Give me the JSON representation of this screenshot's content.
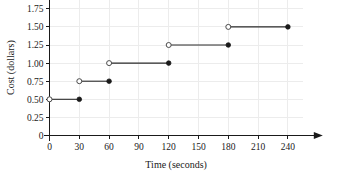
{
  "chart_data": {
    "type": "line",
    "title": "",
    "xlabel": "Time (seconds)",
    "ylabel": "Cost (dollars)",
    "xlim": [
      0,
      255
    ],
    "ylim": [
      0,
      1.875
    ],
    "grid": true,
    "legend": null,
    "xticks": [
      0,
      30,
      60,
      90,
      120,
      150,
      180,
      210,
      240
    ],
    "xtick_labels": [
      "0",
      "30",
      "60",
      "90",
      "120",
      "150",
      "180",
      "210",
      "240"
    ],
    "yticks": [
      0,
      0.25,
      0.5,
      0.75,
      1.0,
      1.25,
      1.5,
      1.75
    ],
    "ytick_labels": [
      "0",
      "0.25",
      "0.50",
      "0.75",
      "1.00",
      "1.25",
      "1.50",
      "1.75"
    ],
    "marker_style": {
      "left_endpoint": "open-circle",
      "right_endpoint": "closed-circle"
    },
    "series": [
      {
        "name": "Cost",
        "style": "step",
        "segments": [
          {
            "x_start": 0,
            "x_end": 30,
            "y": 0.5,
            "left": "open",
            "right": "closed"
          },
          {
            "x_start": 30,
            "x_end": 60,
            "y": 0.75,
            "left": "open",
            "right": "closed"
          },
          {
            "x_start": 60,
            "x_end": 120,
            "y": 1.0,
            "left": "open",
            "right": "closed"
          },
          {
            "x_start": 120,
            "x_end": 180,
            "y": 1.25,
            "left": "open",
            "right": "closed"
          },
          {
            "x_start": 180,
            "x_end": 240,
            "y": 1.5,
            "left": "open",
            "right": "closed"
          }
        ]
      }
    ]
  },
  "axes": {
    "x_axis_name": "time-axis",
    "y_axis_name": "cost-axis"
  }
}
